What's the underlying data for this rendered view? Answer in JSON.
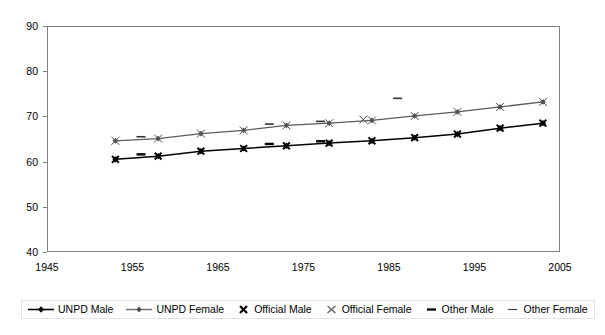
{
  "chart_data": {
    "type": "line",
    "title": "",
    "subtitle": "",
    "xlabel": "",
    "ylabel": "",
    "xlim": [
      1945,
      2005
    ],
    "ylim": [
      40,
      90
    ],
    "xticks": [
      1945,
      1955,
      1965,
      1975,
      1985,
      1995,
      2005
    ],
    "yticks": [
      40,
      50,
      60,
      70,
      80,
      90
    ],
    "grid": "horizontal",
    "legend_position": "bottom",
    "series": [
      {
        "name": "UNPD Male",
        "marker": "diamond",
        "color": "#000000",
        "line": true,
        "x": [
          1953,
          1958,
          1963,
          1968,
          1973,
          1978,
          1983,
          1988,
          1993,
          1998,
          2003
        ],
        "values": [
          60.5,
          61.2,
          62.3,
          62.9,
          63.5,
          64.1,
          64.6,
          65.3,
          66.1,
          67.4,
          68.5
        ]
      },
      {
        "name": "UNPD Female",
        "marker": "diamond",
        "color": "#5a5a5a",
        "line": true,
        "x": [
          1953,
          1958,
          1963,
          1968,
          1973,
          1978,
          1983,
          1988,
          1993,
          1998,
          2003
        ],
        "values": [
          64.6,
          65.1,
          66.2,
          66.9,
          68.0,
          68.5,
          69.1,
          70.1,
          71.0,
          72.1,
          73.2
        ]
      },
      {
        "name": "Official Male",
        "marker": "x-bold",
        "color": "#000000",
        "line": false,
        "x": [
          1953,
          1958,
          1963,
          1968,
          1973,
          1978,
          1983,
          1988,
          1993,
          1998,
          2003
        ],
        "values": [
          60.5,
          61.2,
          62.3,
          62.9,
          63.5,
          64.1,
          64.6,
          65.3,
          66.1,
          67.4,
          68.5
        ]
      },
      {
        "name": "Official Female",
        "marker": "x-thin",
        "color": "#4d4d4d",
        "line": false,
        "x": [
          1953,
          1958,
          1963,
          1968,
          1973,
          1978,
          1982,
          1983,
          1988,
          1993,
          1998,
          2003
        ],
        "values": [
          64.6,
          65.1,
          66.2,
          66.9,
          68.0,
          68.5,
          69.3,
          69.1,
          70.1,
          71.0,
          72.1,
          73.2
        ]
      },
      {
        "name": "Other Male",
        "marker": "dash-bold",
        "color": "#000000",
        "line": false,
        "x": [
          1956,
          1971,
          1977
        ],
        "values": [
          61.6,
          63.9,
          64.5
        ]
      },
      {
        "name": "Other Female",
        "marker": "dash-thin",
        "color": "#333333",
        "line": false,
        "x": [
          1956,
          1971,
          1977,
          1986
        ],
        "values": [
          65.5,
          68.3,
          68.9,
          74.0
        ]
      }
    ]
  },
  "legend": {
    "items": [
      {
        "label": "UNPD Male",
        "key": "line-diamond-black"
      },
      {
        "label": "UNPD Female",
        "key": "line-diamond-grey"
      },
      {
        "label": "Official Male",
        "key": "x-bold"
      },
      {
        "label": "Official Female",
        "key": "x-thin"
      },
      {
        "label": "Other Male",
        "key": "dash-bold"
      },
      {
        "label": "Other Female",
        "key": "dash-thin"
      }
    ]
  },
  "axes": {
    "y_tick_labels": [
      "90",
      "80",
      "70",
      "60",
      "50",
      "40"
    ],
    "x_tick_labels": [
      "1945",
      "1955",
      "1965",
      "1975",
      "1985",
      "1995",
      "2005"
    ]
  },
  "colors": {
    "axis": "#808080",
    "grid": "#d9d9d9",
    "male": "#000000",
    "female": "#5a5a5a",
    "background": "#ffffff"
  }
}
